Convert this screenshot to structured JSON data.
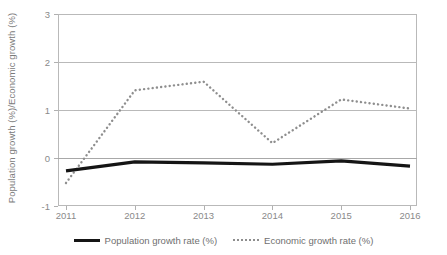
{
  "chart_data": {
    "type": "line",
    "title": "",
    "xlabel": "",
    "ylabel": "Population growth (%)/Economic growth (%)",
    "categories": [
      "2011",
      "2012",
      "2013",
      "2014",
      "2015",
      "2016"
    ],
    "x": [
      2011,
      2012,
      2013,
      2014,
      2015,
      2016
    ],
    "ylim": [
      -1,
      3
    ],
    "y_ticks": [
      3,
      2,
      1,
      0,
      -1
    ],
    "grid": "horizontal",
    "legend_position": "bottom-center",
    "series": [
      {
        "name": "Population growth rate (%)",
        "values": [
          -0.27,
          -0.08,
          -0.1,
          -0.13,
          -0.06,
          -0.17
        ],
        "style": "solid",
        "color": "#151515",
        "width": 3.2
      },
      {
        "name": "Economic growth rate (%)",
        "values": [
          -0.52,
          1.41,
          1.59,
          0.31,
          1.22,
          1.03
        ],
        "style": "dotted",
        "color": "#8e8e8e",
        "width": 2.4
      }
    ]
  },
  "axes": {
    "y_title": "Population growth (%)/Economic growth (%)",
    "y_tick_labels": [
      "3",
      "2",
      "1",
      "0",
      "-1"
    ],
    "x_tick_labels": [
      "2011",
      "2012",
      "2013",
      "2014",
      "2015",
      "2016"
    ]
  },
  "legend": {
    "items": [
      {
        "label": "Population growth rate (%)",
        "marker": "solid-line-swatch"
      },
      {
        "label": "Economic growth rate (%)",
        "marker": "dotted-line-swatch"
      }
    ]
  },
  "colors": {
    "population_line": "#151515",
    "economic_line": "#8e8e8e",
    "gridline": "#b9b9b9",
    "axis_text": "#8a8a8a",
    "background": "#ffffff"
  }
}
